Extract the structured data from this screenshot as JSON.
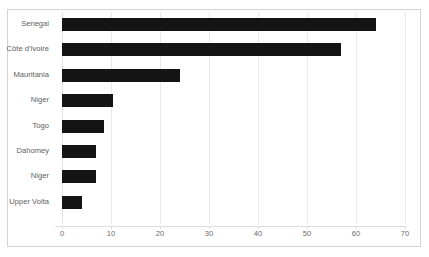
{
  "chart_data": {
    "type": "bar",
    "orientation": "horizontal",
    "title": "",
    "subtitle": "",
    "xlabel": "",
    "ylabel": "",
    "categories": [
      "Senegal",
      "Côte d'Ivoire",
      "Mauritania",
      "Niger",
      "Togo",
      "Dahomey",
      "Niger",
      "Upper Volta"
    ],
    "values": [
      64,
      57,
      24,
      10.5,
      8.5,
      7,
      7,
      4
    ],
    "xlim": [
      0,
      70
    ],
    "xticks": [
      0,
      10,
      20,
      30,
      40,
      50,
      60,
      70
    ],
    "xtick_labels": [
      "0",
      "10",
      "20",
      "30",
      "40",
      "50",
      "60",
      "70"
    ],
    "grid": "vertical",
    "legend": "none",
    "bar_color": "#141414",
    "gridline_color": "#e9e9e9",
    "frame_color": "#d4d4d4",
    "label_color": "#5e5e5e",
    "tick_color": "#6a6a6a"
  }
}
